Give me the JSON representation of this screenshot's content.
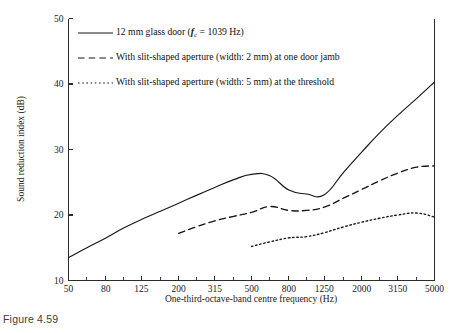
{
  "caption": "Figure 4.59",
  "chart_data": {
    "type": "line",
    "title": "",
    "xlabel": "One-third-octave-band centre frequency (Hz)",
    "ylabel": "Sound reduction index (dB)",
    "x_scale": "log",
    "xlim": [
      50,
      5000
    ],
    "ylim": [
      10,
      50
    ],
    "y_ticks": [
      10,
      20,
      30,
      40,
      50
    ],
    "x_ticks": [
      50,
      80,
      125,
      200,
      315,
      500,
      800,
      1250,
      2000,
      3150,
      5000
    ],
    "x_minor_ticks": [
      50,
      63,
      80,
      100,
      125,
      160,
      200,
      250,
      315,
      400,
      500,
      630,
      800,
      1000,
      1250,
      1600,
      2000,
      2500,
      3150,
      4000,
      5000
    ],
    "grid": false,
    "legend_position": "upper-left",
    "series": [
      {
        "name": "12 mm glass door (fc = 1039 Hz)",
        "label_main": "12 mm glass door (",
        "label_sub_var": "f",
        "label_sub": "c",
        "label_tail": " = 1039 Hz)",
        "style": "solid",
        "color": "#17171a",
        "x": [
          50,
          63,
          80,
          100,
          125,
          160,
          200,
          250,
          315,
          400,
          500,
          630,
          800,
          1000,
          1250,
          1600,
          2000,
          2500,
          3150,
          4000,
          5000
        ],
        "values": [
          13.5,
          15.0,
          16.5,
          18.0,
          19.3,
          20.6,
          21.8,
          23.0,
          24.2,
          25.4,
          26.2,
          26.0,
          23.8,
          23.2,
          23.1,
          26.6,
          29.6,
          32.5,
          35.2,
          37.8,
          40.3
        ]
      },
      {
        "name": "With slit-shaped aperture (width: 2 mm) at one door jamb",
        "label_main": "With slit-shaped aperture (width: 2 mm) at one door jamb",
        "style": "dashed",
        "color": "#17171a",
        "x": [
          200,
          250,
          315,
          400,
          500,
          630,
          800,
          1000,
          1250,
          1600,
          2000,
          2500,
          3150,
          4000,
          5000
        ],
        "values": [
          17.2,
          18.2,
          19.1,
          19.8,
          20.4,
          21.3,
          20.7,
          20.7,
          21.2,
          22.6,
          23.9,
          25.2,
          26.4,
          27.3,
          27.5
        ]
      },
      {
        "name": "With slit-shaped aperture (width: 5 mm) at the threshold",
        "label_main": "With slit-shaped aperture (width: 5 mm) at the threshold",
        "style": "dotted",
        "color": "#17171a",
        "x": [
          500,
          630,
          800,
          1000,
          1250,
          1600,
          2000,
          2500,
          3150,
          4000,
          5000
        ],
        "values": [
          15.2,
          15.9,
          16.5,
          16.7,
          17.3,
          18.2,
          18.9,
          19.5,
          20.0,
          20.3,
          19.7
        ]
      }
    ]
  }
}
